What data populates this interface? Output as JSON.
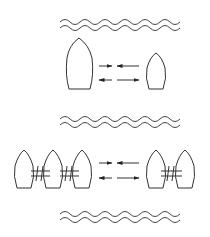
{
  "diagram": {
    "type": "ship-interaction-schematic",
    "stroke_color": "#333333",
    "background": "#ffffff",
    "panels": [
      {
        "name": "single-ships",
        "left_group": {
          "count": 1,
          "size": "large"
        },
        "right_group": {
          "count": 1,
          "size": "small"
        },
        "arrows": [
          {
            "row": "top",
            "pattern": "inward"
          },
          {
            "row": "bottom",
            "pattern": "outward"
          }
        ]
      },
      {
        "name": "coupled-ships",
        "left_group": {
          "count": 3,
          "size": "medium",
          "coupled": true
        },
        "right_group": {
          "count": 2,
          "size": "medium",
          "coupled": true
        },
        "arrows": [
          {
            "row": "top",
            "pattern": "inward"
          },
          {
            "row": "bottom",
            "pattern": "outward"
          }
        ]
      }
    ],
    "wave_bands": 3
  }
}
